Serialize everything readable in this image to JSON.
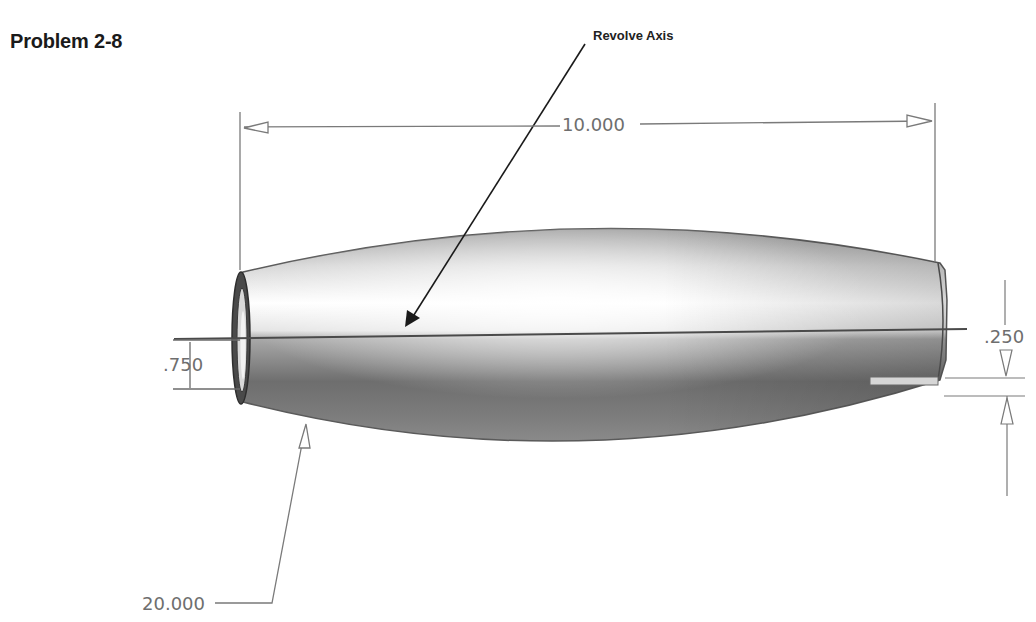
{
  "title": "Problem 2-8",
  "callout": {
    "label": "Revolve Axis"
  },
  "dimensions": {
    "overall_length": "10.000",
    "end_diameter_left": ".750",
    "end_offset_right": ".250",
    "arc_radius": "20.000"
  },
  "colors": {
    "dimension_line": "#7a7a7a",
    "dimension_text": "#6e6e6e",
    "body_light": "#f5f5f5",
    "body_dark": "#6a6a6a",
    "outline": "#555555",
    "axis_line": "#4a4a4a",
    "leader_arrow": "#1a1a1a"
  }
}
